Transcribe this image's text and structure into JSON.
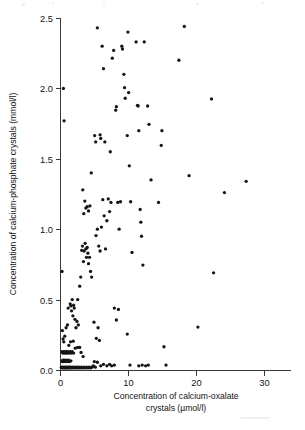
{
  "chart_data": {
    "type": "scatter",
    "title": "",
    "subtitle": "",
    "xlabel": "Concentration of calcium-oxalate",
    "xlabel_line2": "crystals (µmol/l)",
    "xlabel_full": "Concentration of calcium-oxalate crystals (µmol/l)",
    "ylabel": "Concentration of calcium-phosphate crystals (mmol/l)",
    "xlim": [
      0,
      34
    ],
    "ylim": [
      0.0,
      2.5
    ],
    "xticks": [
      0,
      10,
      20,
      30
    ],
    "xtick_labels": [
      "0",
      "10",
      "20",
      "30"
    ],
    "yticks": [
      0.0,
      0.5,
      1.0,
      1.5,
      2.0,
      2.5
    ],
    "ytick_labels": [
      "0.0",
      "0.5",
      "1.0",
      "1.5",
      "2.0",
      "2.5"
    ],
    "grid": false,
    "legend": false,
    "legend_position": "none",
    "marker_color": "#151515",
    "marker_shape": "circle",
    "marker_radius": 1.65,
    "axis_color": "#3a3a3a",
    "n_points": 191,
    "points": [
      [
        0.3,
        0.7
      ],
      [
        0.5,
        2.0
      ],
      [
        0.6,
        1.77
      ],
      [
        0.35,
        0.28
      ],
      [
        0.45,
        0.22
      ],
      [
        0.55,
        0.2
      ],
      [
        0.7,
        0.24
      ],
      [
        0.3,
        0.13
      ],
      [
        0.4,
        0.12
      ],
      [
        0.5,
        0.13
      ],
      [
        0.62,
        0.12
      ],
      [
        0.75,
        0.13
      ],
      [
        0.85,
        0.12
      ],
      [
        0.95,
        0.13
      ],
      [
        1.05,
        0.12
      ],
      [
        1.2,
        0.13
      ],
      [
        1.35,
        0.12
      ],
      [
        1.5,
        0.13
      ],
      [
        1.65,
        0.12
      ],
      [
        1.8,
        0.13
      ],
      [
        2.0,
        0.12
      ],
      [
        0.25,
        0.065
      ],
      [
        0.35,
        0.06
      ],
      [
        0.45,
        0.07
      ],
      [
        0.55,
        0.06
      ],
      [
        0.65,
        0.07
      ],
      [
        0.8,
        0.06
      ],
      [
        0.95,
        0.07
      ],
      [
        1.1,
        0.06
      ],
      [
        1.25,
        0.07
      ],
      [
        1.4,
        0.06
      ],
      [
        1.6,
        0.065
      ],
      [
        0.2,
        0.02
      ],
      [
        0.3,
        0.015
      ],
      [
        0.4,
        0.02
      ],
      [
        0.5,
        0.015
      ],
      [
        0.6,
        0.02
      ],
      [
        0.7,
        0.015
      ],
      [
        0.8,
        0.02
      ],
      [
        0.9,
        0.015
      ],
      [
        1.0,
        0.02
      ],
      [
        1.1,
        0.015
      ],
      [
        1.2,
        0.02
      ],
      [
        1.3,
        0.015
      ],
      [
        1.4,
        0.02
      ],
      [
        1.5,
        0.015
      ],
      [
        1.6,
        0.02
      ],
      [
        1.75,
        0.015
      ],
      [
        1.9,
        0.02
      ],
      [
        2.05,
        0.015
      ],
      [
        2.2,
        0.02
      ],
      [
        2.35,
        0.015
      ],
      [
        2.5,
        0.02
      ],
      [
        2.65,
        0.015
      ],
      [
        2.8,
        0.02
      ],
      [
        2.95,
        0.015
      ],
      [
        3.1,
        0.02
      ],
      [
        3.3,
        0.015
      ],
      [
        3.5,
        0.02
      ],
      [
        3.7,
        0.015
      ],
      [
        3.9,
        0.02
      ],
      [
        4.1,
        0.015
      ],
      [
        4.3,
        0.02
      ],
      [
        4.5,
        0.015
      ],
      [
        4.7,
        0.02
      ],
      [
        4.9,
        0.03
      ],
      [
        5.2,
        0.02
      ],
      [
        0.9,
        0.3
      ],
      [
        1.1,
        0.32
      ],
      [
        1.2,
        0.44
      ],
      [
        1.5,
        0.47
      ],
      [
        1.6,
        0.455
      ],
      [
        1.7,
        0.42
      ],
      [
        1.8,
        0.5
      ],
      [
        1.9,
        0.385
      ],
      [
        2.0,
        0.46
      ],
      [
        2.1,
        0.44
      ],
      [
        2.2,
        0.36
      ],
      [
        2.35,
        0.3
      ],
      [
        2.5,
        0.345
      ],
      [
        2.6,
        0.5
      ],
      [
        2.7,
        0.32
      ],
      [
        1.3,
        0.175
      ],
      [
        1.55,
        0.2
      ],
      [
        1.95,
        0.205
      ],
      [
        2.25,
        0.155
      ],
      [
        2.6,
        0.16
      ],
      [
        2.9,
        0.16
      ],
      [
        3.1,
        0.125
      ],
      [
        3.4,
        0.095
      ],
      [
        2.9,
        0.595
      ],
      [
        3.05,
        0.66
      ],
      [
        3.2,
        0.85
      ],
      [
        3.3,
        0.88
      ],
      [
        3.45,
        0.77
      ],
      [
        3.55,
        0.845
      ],
      [
        3.7,
        0.9
      ],
      [
        3.8,
        0.86
      ],
      [
        3.9,
        0.8
      ],
      [
        4.0,
        0.87
      ],
      [
        4.1,
        0.83
      ],
      [
        4.2,
        0.755
      ],
      [
        4.35,
        0.8
      ],
      [
        4.5,
        0.7
      ],
      [
        4.65,
        0.66
      ],
      [
        3.35,
        1.28
      ],
      [
        3.5,
        1.11
      ],
      [
        3.65,
        1.2
      ],
      [
        3.8,
        1.15
      ],
      [
        4.0,
        1.16
      ],
      [
        4.2,
        1.13
      ],
      [
        4.4,
        1.165
      ],
      [
        4.6,
        1.4
      ],
      [
        5.1,
        1.665
      ],
      [
        5.25,
        1.62
      ],
      [
        5.5,
        2.43
      ],
      [
        5.9,
        1.67
      ],
      [
        6.0,
        1.645
      ],
      [
        5.0,
        0.34
      ],
      [
        5.35,
        0.225
      ],
      [
        5.6,
        0.3
      ],
      [
        5.8,
        0.21
      ],
      [
        5.05,
        0.06
      ],
      [
        5.5,
        0.055
      ],
      [
        6.0,
        0.03
      ],
      [
        6.4,
        0.04
      ],
      [
        6.9,
        0.03
      ],
      [
        7.3,
        0.04
      ],
      [
        7.6,
        0.03
      ],
      [
        8.0,
        0.035
      ],
      [
        5.3,
        0.955
      ],
      [
        5.5,
        1.0
      ],
      [
        5.7,
        0.88
      ],
      [
        5.9,
        0.845
      ],
      [
        6.1,
        1.015
      ],
      [
        6.3,
        1.21
      ],
      [
        6.5,
        1.095
      ],
      [
        6.7,
        0.86
      ],
      [
        6.9,
        1.06
      ],
      [
        7.1,
        1.215
      ],
      [
        7.3,
        1.125
      ],
      [
        7.5,
        1.19
      ],
      [
        6.2,
        2.3
      ],
      [
        6.4,
        2.14
      ],
      [
        6.6,
        1.62
      ],
      [
        7.4,
        1.55
      ],
      [
        7.7,
        2.215
      ],
      [
        7.9,
        2.27
      ],
      [
        8.2,
        1.845
      ],
      [
        8.3,
        1.87
      ],
      [
        8.5,
        1.19
      ],
      [
        8.7,
        1.0
      ],
      [
        8.9,
        1.195
      ],
      [
        8.0,
        0.44
      ],
      [
        8.3,
        0.355
      ],
      [
        8.6,
        0.43
      ],
      [
        9.1,
        2.3
      ],
      [
        9.2,
        2.28
      ],
      [
        9.4,
        2.1
      ],
      [
        9.5,
        2.005
      ],
      [
        9.6,
        1.93
      ],
      [
        9.9,
        1.665
      ],
      [
        10.0,
        2.4
      ],
      [
        10.1,
        1.97
      ],
      [
        10.2,
        1.45
      ],
      [
        10.4,
        1.195
      ],
      [
        10.6,
        0.835
      ],
      [
        9.9,
        0.255
      ],
      [
        10.3,
        0.035
      ],
      [
        11.2,
        2.33
      ],
      [
        11.4,
        1.88
      ],
      [
        11.5,
        1.875
      ],
      [
        11.6,
        1.7
      ],
      [
        11.8,
        1.14
      ],
      [
        11.9,
        1.05
      ],
      [
        12.0,
        0.95
      ],
      [
        12.2,
        0.745
      ],
      [
        11.6,
        0.03
      ],
      [
        12.1,
        0.035
      ],
      [
        12.6,
        0.03
      ],
      [
        12.4,
        2.33
      ],
      [
        12.9,
        1.875
      ],
      [
        13.1,
        1.745
      ],
      [
        13.4,
        1.35
      ],
      [
        13.0,
        0.035
      ],
      [
        14.5,
        1.19
      ],
      [
        14.9,
        1.595
      ],
      [
        15.0,
        1.7
      ],
      [
        15.3,
        0.165
      ],
      [
        15.6,
        0.035
      ],
      [
        17.5,
        2.2
      ],
      [
        18.3,
        2.44
      ],
      [
        19.0,
        1.38
      ],
      [
        20.3,
        0.305
      ],
      [
        22.3,
        1.925
      ],
      [
        22.6,
        0.69
      ],
      [
        24.2,
        1.26
      ],
      [
        27.4,
        1.34
      ]
    ]
  },
  "figure": {
    "background_color": "#ffffff",
    "plot_area": {
      "left_px": 60,
      "right_px": 291,
      "top_px": 18,
      "bottom_px": 370
    }
  }
}
